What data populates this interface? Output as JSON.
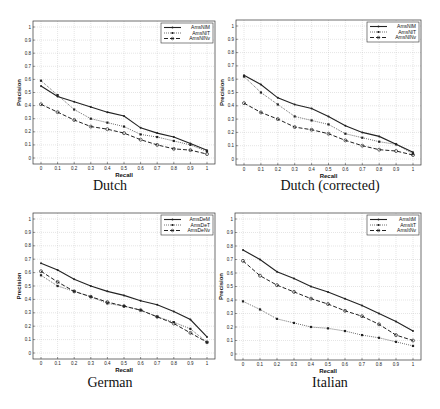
{
  "chart_data": [
    {
      "type": "line",
      "title": "Dutch",
      "xlabel": "Recall",
      "ylabel": "Precision",
      "xlim": [
        0,
        1
      ],
      "ylim": [
        0,
        1
      ],
      "grid": true,
      "legend_position": "upper right",
      "x": [
        0,
        0.1,
        0.2,
        0.3,
        0.4,
        0.5,
        0.6,
        0.7,
        0.8,
        0.9,
        1
      ],
      "x_tick_labels": [
        "0",
        "0.1",
        "0.2",
        "0.3",
        "0.4",
        "0.5",
        "0.6",
        "0.7",
        "0.8",
        "0.9",
        "1"
      ],
      "y_tick_labels": [
        "0",
        "0.1",
        "0.2",
        "0.3",
        "0.4",
        "0.5",
        "0.6",
        "0.7",
        "0.8",
        "0.9",
        "1"
      ],
      "series": [
        {
          "name": "AmsNlM",
          "style": "solid",
          "values": [
            0.55,
            0.47,
            0.43,
            0.39,
            0.35,
            0.32,
            0.23,
            0.19,
            0.16,
            0.11,
            0.06
          ]
        },
        {
          "name": "AmsNlT",
          "style": "dotted",
          "values": [
            0.59,
            0.48,
            0.37,
            0.3,
            0.27,
            0.24,
            0.18,
            0.16,
            0.13,
            0.1,
            0.05
          ]
        },
        {
          "name": "AmsNlNv",
          "style": "dashed",
          "values": [
            0.41,
            0.35,
            0.29,
            0.24,
            0.22,
            0.19,
            0.14,
            0.1,
            0.07,
            0.06,
            0.03
          ]
        }
      ]
    },
    {
      "type": "line",
      "title": "Dutch (corrected)",
      "xlabel": "Recall",
      "ylabel": "Precision",
      "xlim": [
        0,
        1
      ],
      "ylim": [
        0,
        1
      ],
      "grid": true,
      "legend_position": "upper right",
      "x": [
        0,
        0.1,
        0.2,
        0.3,
        0.4,
        0.5,
        0.6,
        0.7,
        0.8,
        0.9,
        1
      ],
      "x_tick_labels": [
        "0",
        "0.1",
        "0.2",
        "0.3",
        "0.4",
        "0.5",
        "0.6",
        "0.7",
        "0.8",
        "0.9",
        "1"
      ],
      "y_tick_labels": [
        "0",
        "0.1",
        "0.2",
        "0.3",
        "0.4",
        "0.5",
        "0.6",
        "0.7",
        "0.8",
        "0.9",
        "1"
      ],
      "series": [
        {
          "name": "AmsNlM",
          "style": "solid",
          "values": [
            0.63,
            0.56,
            0.46,
            0.41,
            0.38,
            0.32,
            0.25,
            0.2,
            0.17,
            0.11,
            0.05
          ]
        },
        {
          "name": "AmsNlT",
          "style": "dotted",
          "values": [
            0.62,
            0.5,
            0.41,
            0.32,
            0.29,
            0.26,
            0.19,
            0.16,
            0.13,
            0.11,
            0.04
          ]
        },
        {
          "name": "AmsNlNv",
          "style": "dashed",
          "values": [
            0.42,
            0.35,
            0.3,
            0.24,
            0.22,
            0.19,
            0.14,
            0.1,
            0.07,
            0.06,
            0.03
          ]
        }
      ]
    },
    {
      "type": "line",
      "title": "German",
      "xlabel": "Recall",
      "ylabel": "Precision",
      "xlim": [
        0,
        1
      ],
      "ylim": [
        0,
        1
      ],
      "grid": true,
      "legend_position": "upper right",
      "x": [
        0,
        0.1,
        0.2,
        0.3,
        0.4,
        0.5,
        0.6,
        0.7,
        0.8,
        0.9,
        1
      ],
      "x_tick_labels": [
        "0",
        "0.1",
        "0.2",
        "0.3",
        "0.4",
        "0.5",
        "0.6",
        "0.7",
        "0.8",
        "0.9",
        "1"
      ],
      "y_tick_labels": [
        "0",
        "0.1",
        "0.2",
        "0.3",
        "0.4",
        "0.5",
        "0.6",
        "0.7",
        "0.8",
        "0.9",
        "1"
      ],
      "series": [
        {
          "name": "AmsDeM",
          "style": "solid",
          "values": [
            0.67,
            0.62,
            0.55,
            0.5,
            0.46,
            0.43,
            0.39,
            0.36,
            0.31,
            0.25,
            0.12
          ]
        },
        {
          "name": "AmsDeT",
          "style": "dotted",
          "values": [
            0.58,
            0.5,
            0.46,
            0.42,
            0.37,
            0.35,
            0.32,
            0.27,
            0.23,
            0.18,
            0.08
          ]
        },
        {
          "name": "AmsDeNv",
          "style": "dashed",
          "values": [
            0.61,
            0.53,
            0.46,
            0.42,
            0.38,
            0.35,
            0.32,
            0.27,
            0.22,
            0.15,
            0.08
          ]
        }
      ]
    },
    {
      "type": "line",
      "title": "Italian",
      "xlabel": "Recall",
      "ylabel": "Precision",
      "xlim": [
        0,
        1
      ],
      "ylim": [
        0,
        1
      ],
      "grid": true,
      "legend_position": "upper right",
      "x": [
        0,
        0.1,
        0.2,
        0.3,
        0.4,
        0.5,
        0.6,
        0.7,
        0.8,
        0.9,
        1
      ],
      "x_tick_labels": [
        "0",
        "0.1",
        "0.2",
        "0.3",
        "0.4",
        "0.5",
        "0.6",
        "0.7",
        "0.8",
        "0.9",
        "1"
      ],
      "y_tick_labels": [
        "0",
        "0.1",
        "0.2",
        "0.3",
        "0.4",
        "0.5",
        "0.6",
        "0.7",
        "0.8",
        "0.9",
        "1"
      ],
      "series": [
        {
          "name": "AmsItM",
          "style": "solid",
          "values": [
            0.77,
            0.7,
            0.61,
            0.56,
            0.5,
            0.46,
            0.41,
            0.36,
            0.3,
            0.24,
            0.17
          ]
        },
        {
          "name": "AmsItT",
          "style": "dotted",
          "values": [
            0.39,
            0.33,
            0.26,
            0.23,
            0.2,
            0.19,
            0.17,
            0.14,
            0.12,
            0.09,
            0.06
          ]
        },
        {
          "name": "AmsItNv",
          "style": "dashed",
          "values": [
            0.69,
            0.58,
            0.51,
            0.46,
            0.41,
            0.37,
            0.32,
            0.28,
            0.22,
            0.14,
            0.1
          ]
        }
      ]
    }
  ],
  "captions": [
    "Dutch",
    "Dutch (corrected)",
    "German",
    "Italian"
  ],
  "colors": {
    "line": "#222222",
    "grid": "#bdbdbd",
    "frame": "#333333",
    "background": "#ffffff"
  }
}
